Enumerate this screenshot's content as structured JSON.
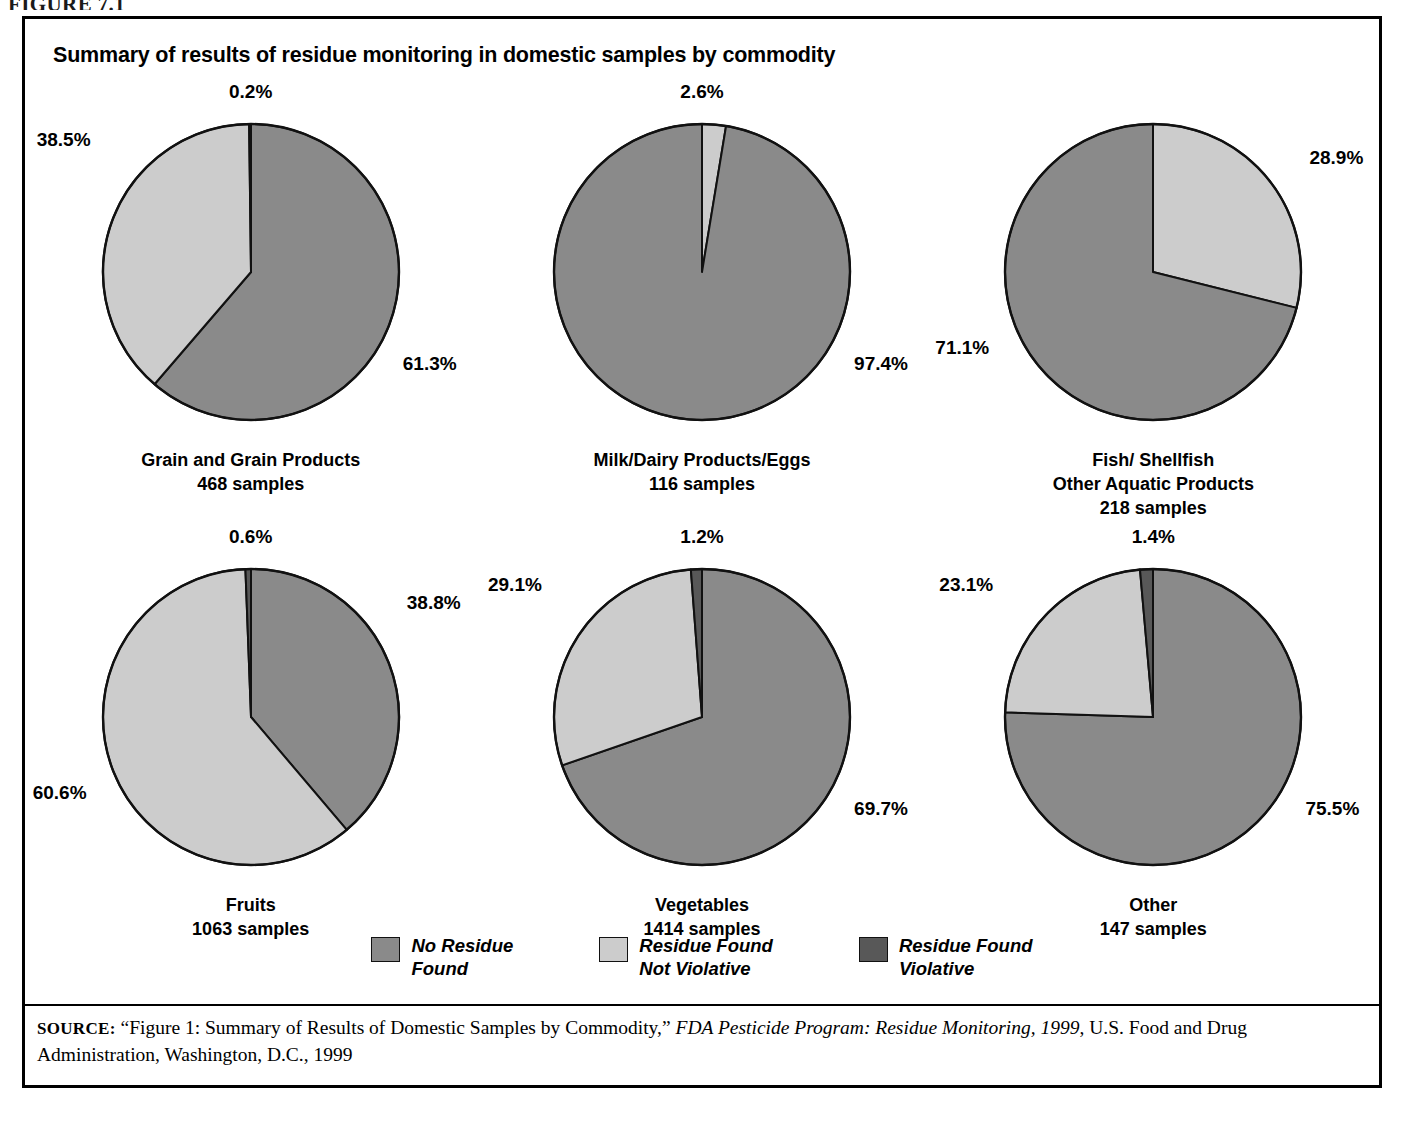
{
  "figure_label": "FIGURE 7.1",
  "chart_title": "Summary of results of residue monitoring in domestic samples by commodity",
  "colors": {
    "no_residue_found": "#8a8a8a",
    "residue_found_not_violative": "#cccccc",
    "residue_found_violative": "#585858",
    "outline": "#111111",
    "panel_border": "#000000",
    "background": "#ffffff"
  },
  "legend": {
    "items": [
      {
        "name": "legend-no-residue-found",
        "line1": "No Residue",
        "line2": "Found",
        "color": "#8a8a8a"
      },
      {
        "name": "legend-residue-found-not-violative",
        "line1": "Residue Found",
        "line2": "Not Violative",
        "color": "#cccccc"
      },
      {
        "name": "legend-residue-found-violative",
        "line1": "Residue Found",
        "line2": "Violative",
        "color": "#585858"
      }
    ]
  },
  "source": {
    "prefix": "SOURCE:",
    "text_before_italic": "“Figure 1: Summary of Results of Domestic Samples by Commodity,” ",
    "italic_title": "FDA Pesticide Program: Residue Monitoring, 1999",
    "text_after_italic": ", U.S. Food and Drug Administration, Washington, D.C., 1999"
  },
  "chart_data": {
    "type": "pie",
    "title": "Summary of results of residue monitoring in domestic samples by commodity",
    "legend_position": "bottom",
    "categories": [
      "No Residue Found",
      "Residue Found Not Violative",
      "Residue Found Violative"
    ],
    "category_colors": [
      "#8a8a8a",
      "#cccccc",
      "#585858"
    ],
    "units": "percent",
    "charts": [
      {
        "id": "grain-and-grain-products",
        "caption_line1": "Grain and Grain Products",
        "caption_line2": "468 samples",
        "samples": 468,
        "slices": [
          {
            "label": "No Residue Found",
            "value": 61.3,
            "display": "61.3%",
            "color": "#8a8a8a"
          },
          {
            "label": "Residue Found Not Violative",
            "value": 38.5,
            "display": "38.5%",
            "color": "#cccccc"
          },
          {
            "label": "Residue Found Violative",
            "value": 0.2,
            "display": "0.2%",
            "color": "#585858"
          }
        ]
      },
      {
        "id": "milk-dairy-products-eggs",
        "caption_line1": "Milk/Dairy Products/Eggs",
        "caption_line2": "116 samples",
        "samples": 116,
        "slices": [
          {
            "label": "Residue Found Not Violative",
            "value": 2.6,
            "display": "2.6%",
            "color": "#cccccc"
          },
          {
            "label": "No Residue Found",
            "value": 97.4,
            "display": "97.4%",
            "color": "#8a8a8a"
          }
        ]
      },
      {
        "id": "fish-shellfish-other-aquatic-products",
        "caption_line1": "Fish/ Shellfish",
        "caption_line2": "Other Aquatic Products",
        "caption_line3": "218 samples",
        "samples": 218,
        "slices": [
          {
            "label": "Residue Found Not Violative",
            "value": 28.9,
            "display": "28.9%",
            "color": "#cccccc"
          },
          {
            "label": "No Residue Found",
            "value": 71.1,
            "display": "71.1%",
            "color": "#8a8a8a"
          }
        ]
      },
      {
        "id": "fruits",
        "caption_line1": "Fruits",
        "caption_line2": "1063 samples",
        "samples": 1063,
        "slices": [
          {
            "label": "No Residue Found",
            "value": 38.8,
            "display": "38.8%",
            "color": "#8a8a8a"
          },
          {
            "label": "Residue Found Not Violative",
            "value": 60.6,
            "display": "60.6%",
            "color": "#cccccc"
          },
          {
            "label": "Residue Found Violative",
            "value": 0.6,
            "display": "0.6%",
            "color": "#585858"
          }
        ]
      },
      {
        "id": "vegetables",
        "caption_line1": "Vegetables",
        "caption_line2": "1414 samples",
        "samples": 1414,
        "slices": [
          {
            "label": "No Residue Found",
            "value": 69.7,
            "display": "69.7%",
            "color": "#8a8a8a"
          },
          {
            "label": "Residue Found Not Violative",
            "value": 29.1,
            "display": "29.1%",
            "color": "#cccccc"
          },
          {
            "label": "Residue Found Violative",
            "value": 1.2,
            "display": "1.2%",
            "color": "#585858"
          }
        ]
      },
      {
        "id": "other",
        "caption_line1": "Other",
        "caption_line2": "147 samples",
        "samples": 147,
        "slices": [
          {
            "label": "No Residue Found",
            "value": 75.5,
            "display": "75.5%",
            "color": "#8a8a8a"
          },
          {
            "label": "Residue Found Not Violative",
            "value": 23.1,
            "display": "23.1%",
            "color": "#cccccc"
          },
          {
            "label": "Residue Found Violative",
            "value": 1.4,
            "display": "1.4%",
            "color": "#585858"
          }
        ]
      }
    ]
  },
  "pies": [
    {
      "labels": [
        {
          "text": "0.2%",
          "pos": "top"
        },
        {
          "text": "38.5%",
          "pos": "upper-left"
        },
        {
          "text": "61.3%",
          "pos": "lower-right"
        }
      ]
    },
    {
      "labels": [
        {
          "text": "2.6%",
          "pos": "top"
        },
        {
          "text": "97.4%",
          "pos": "lower-right"
        }
      ]
    },
    {
      "labels": [
        {
          "text": "28.9%",
          "pos": "upper-right"
        },
        {
          "text": "71.1%",
          "pos": "lower-left"
        }
      ]
    },
    {
      "labels": [
        {
          "text": "0.6%",
          "pos": "top"
        },
        {
          "text": "38.8%",
          "pos": "upper-right"
        },
        {
          "text": "60.6%",
          "pos": "lower-left"
        }
      ]
    },
    {
      "labels": [
        {
          "text": "1.2%",
          "pos": "top"
        },
        {
          "text": "29.1%",
          "pos": "upper-left"
        },
        {
          "text": "69.7%",
          "pos": "lower-right"
        }
      ]
    },
    {
      "labels": [
        {
          "text": "1.4%",
          "pos": "top"
        },
        {
          "text": "23.1%",
          "pos": "upper-left"
        },
        {
          "text": "75.5%",
          "pos": "lower-right"
        }
      ]
    }
  ]
}
